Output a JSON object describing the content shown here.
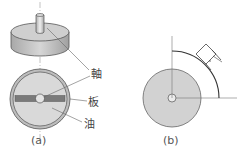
{
  "figure_a": {
    "caption": "(a)",
    "labels": {
      "shaft": "軸",
      "plate": "板",
      "oil": "油"
    }
  },
  "figure_b": {
    "caption": "(b)"
  },
  "colors": {
    "body_fill": "#c8c8c8",
    "disc_fill": "#d4d4d4",
    "plate_fill": "#7a7a7a",
    "stroke": "#555555",
    "centerline": "#999999"
  }
}
